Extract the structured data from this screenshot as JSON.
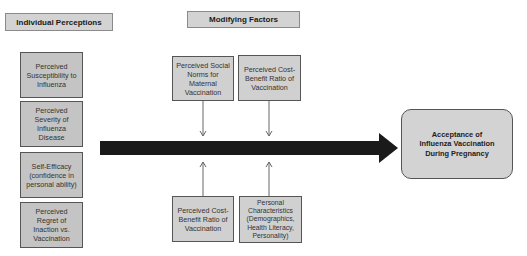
{
  "diagram": {
    "headers": {
      "individual": "Individual Perceptions",
      "modifying": "Modifying Factors"
    },
    "individual_perceptions": [
      {
        "label": "Perceived\nSusceptibility to\nInfluenza"
      },
      {
        "label": "Perceived\nSeverity of\nInfluenza\nDisease"
      },
      {
        "label": "Self-Efficacy\n(confidence in\npersonal ability)"
      },
      {
        "label": "Perceived\nRegret of\nInaction vs.\nVaccination"
      }
    ],
    "modifying_factors_top": [
      {
        "label": "Perceived Social\nNorms for\nMaternal\nVaccination"
      },
      {
        "label": "Perceived Cost-\nBenefit Ratio of\nVaccination"
      }
    ],
    "modifying_factors_bottom": [
      {
        "label": "Perceived Cost-\nBenefit Ratio of\nVaccination"
      },
      {
        "label": "Personal\nCharacteristics\n(Demographics,\nHealth Literacy,\nPersonality)"
      }
    ],
    "outcome": {
      "label": "Acceptance of\nInfluenza Vaccination\nDuring Pregnancy"
    },
    "colors": {
      "box_fill": "#c4c4c4",
      "header_fill": "#d3d3d3",
      "arrow": "#1a1a1a",
      "connector": "#666666"
    }
  }
}
